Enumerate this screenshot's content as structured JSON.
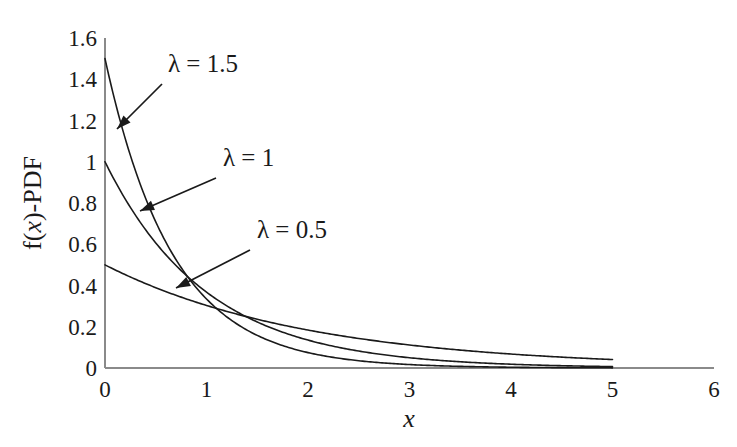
{
  "chart_data": {
    "type": "line",
    "title": "",
    "subtitle": "",
    "xlabel": "x",
    "ylabel": "f(x)-PDF",
    "xlim": [
      0,
      6
    ],
    "ylim": [
      0,
      1.6
    ],
    "grid": false,
    "legend_position": "inline-annotations",
    "x_ticks": [
      "0",
      "1",
      "2",
      "3",
      "4",
      "5",
      "6"
    ],
    "x_tick_values": [
      0,
      1,
      2,
      3,
      4,
      5,
      6
    ],
    "y_ticks": [
      "0",
      "0.2",
      "0.4",
      "0.6",
      "0.8",
      "1",
      "1.2",
      "1.4",
      "1.6"
    ],
    "y_tick_values": [
      0,
      0.2,
      0.4,
      0.6,
      0.8,
      1,
      1.2,
      1.4,
      1.6
    ],
    "function": "f(x) = lambda * exp(-lambda * x)",
    "x_domain_drawn": [
      0,
      5
    ],
    "line_color": "#1a1a1a",
    "axis_color": "#808080",
    "background_color": "#ffffff",
    "series": [
      {
        "name": "lambda = 1.5",
        "lambda": 1.5,
        "x": [
          0,
          0.25,
          0.5,
          0.75,
          1,
          1.25,
          1.5,
          1.75,
          2,
          2.25,
          2.5,
          2.75,
          3,
          3.25,
          3.5,
          3.75,
          4,
          4.25,
          4.5,
          4.75,
          5
        ],
        "values": [
          1.5,
          1.03,
          0.709,
          0.487,
          0.335,
          0.23,
          0.158,
          0.109,
          0.075,
          0.051,
          0.035,
          0.024,
          0.017,
          0.011,
          0.008,
          0.005,
          0.004,
          0.003,
          0.002,
          0.001,
          0.001
        ]
      },
      {
        "name": "lambda = 1",
        "lambda": 1,
        "x": [
          0,
          0.25,
          0.5,
          0.75,
          1,
          1.25,
          1.5,
          1.75,
          2,
          2.25,
          2.5,
          2.75,
          3,
          3.25,
          3.5,
          3.75,
          4,
          4.25,
          4.5,
          4.75,
          5
        ],
        "values": [
          1.0,
          0.779,
          0.607,
          0.472,
          0.368,
          0.287,
          0.223,
          0.174,
          0.135,
          0.105,
          0.082,
          0.064,
          0.05,
          0.039,
          0.03,
          0.024,
          0.018,
          0.014,
          0.011,
          0.009,
          0.007
        ]
      },
      {
        "name": "lambda = 0.5",
        "lambda": 0.5,
        "x": [
          0,
          0.25,
          0.5,
          0.75,
          1,
          1.25,
          1.5,
          1.75,
          2,
          2.25,
          2.5,
          2.75,
          3,
          3.25,
          3.5,
          3.75,
          4,
          4.25,
          4.5,
          4.75,
          5
        ],
        "values": [
          0.5,
          0.441,
          0.389,
          0.344,
          0.303,
          0.268,
          0.236,
          0.208,
          0.184,
          0.162,
          0.143,
          0.126,
          0.112,
          0.099,
          0.087,
          0.077,
          0.068,
          0.06,
          0.053,
          0.046,
          0.041
        ]
      }
    ],
    "annotations": [
      {
        "label": "λ = 1.5",
        "label_x": 168,
        "label_y": 72,
        "arrow_from_x": 162,
        "arrow_from_y": 84,
        "arrow_to_x": 117,
        "arrow_to_y": 129
      },
      {
        "label": "λ = 1",
        "label_x": 223,
        "label_y": 166,
        "arrow_from_x": 216,
        "arrow_from_y": 178,
        "arrow_to_x": 140,
        "arrow_to_y": 211
      },
      {
        "label": "λ = 0.5",
        "label_x": 257,
        "label_y": 238,
        "arrow_from_x": 250,
        "arrow_from_y": 250,
        "arrow_to_x": 176,
        "arrow_to_y": 288
      }
    ]
  },
  "axes": {
    "x_axis_label_prefix": "",
    "x_axis_label": "x",
    "y_axis_label_part1": "f(",
    "y_axis_label_italic": "x",
    "y_axis_label_part2": ")-PDF"
  }
}
